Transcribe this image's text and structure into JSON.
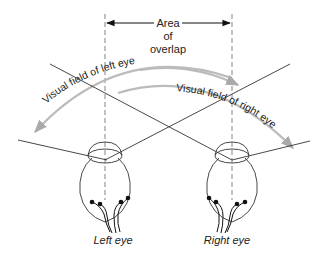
{
  "overlap_label": {
    "line1": "Area",
    "line2": "of",
    "line3": "overlap"
  },
  "fields": {
    "left": "Visual field of left eye",
    "right": "Visual field of right eye"
  },
  "eyes": {
    "left": "Left eye",
    "right": "Right eye"
  },
  "colors": {
    "line": "#333333",
    "arc": "#bbbbbb",
    "dash": "#777777"
  }
}
